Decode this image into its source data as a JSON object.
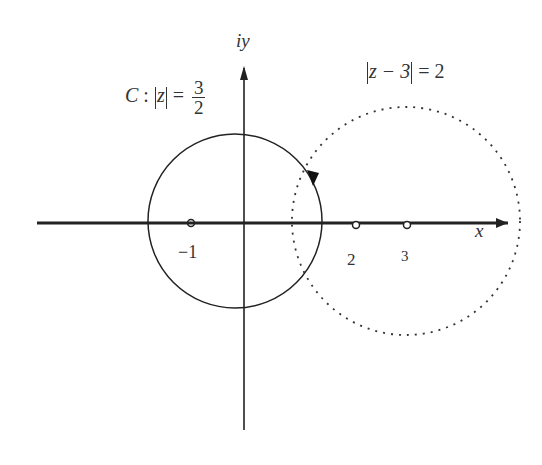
{
  "diagram": {
    "axes": {
      "x_label": "x",
      "y_label": "iy"
    },
    "contour_C": {
      "name": "C",
      "equation_lhs": "|z|",
      "equation_rhs_numerator": "3",
      "equation_rhs_denominator": "2",
      "style": "solid",
      "center": [
        0,
        0
      ],
      "radius": 1.5,
      "orientation": "counterclockwise"
    },
    "circle_2": {
      "equation_inner": "z − 3",
      "equation_rhs": "2",
      "style": "dotted",
      "center": [
        3,
        0
      ],
      "radius": 2
    },
    "points": [
      {
        "label": "−1",
        "value": -1
      },
      {
        "label": "2",
        "value": 2
      },
      {
        "label": "3",
        "value": 3
      }
    ],
    "colors": {
      "line": "#222222",
      "text": "#333333",
      "background": "#ffffff"
    }
  }
}
